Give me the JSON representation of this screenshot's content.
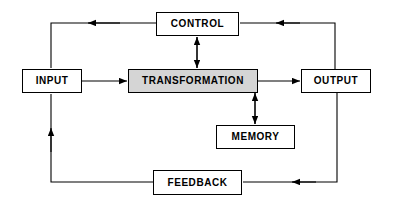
{
  "diagram": {
    "background_color": "#ffffff",
    "line_color": "#000000",
    "shaded_fill": "#d5d5d5",
    "nodes": {
      "control": {
        "label": "CONTROL",
        "fill": "#ffffff"
      },
      "input": {
        "label": "INPUT",
        "fill": "#ffffff"
      },
      "transformation": {
        "label": "TRANSFORMATION",
        "fill": "#d5d5d5"
      },
      "output": {
        "label": "OUTPUT",
        "fill": "#ffffff"
      },
      "memory": {
        "label": "MEMORY",
        "fill": "#ffffff"
      },
      "feedback": {
        "label": "FEEDBACK",
        "fill": "#ffffff"
      }
    },
    "connections": [
      {
        "from": "input",
        "to": "transformation",
        "arrow": "single",
        "direction": "right"
      },
      {
        "from": "transformation",
        "to": "output",
        "arrow": "single",
        "direction": "right"
      },
      {
        "from": "control",
        "to": "transformation",
        "arrow": "double",
        "direction": "vertical"
      },
      {
        "from": "transformation",
        "to": "memory",
        "arrow": "double",
        "direction": "vertical"
      },
      {
        "from": "output",
        "to": "control",
        "arrow": "single",
        "direction": "left"
      },
      {
        "from": "control",
        "to": "input",
        "arrow": "single",
        "direction": "left-down"
      },
      {
        "from": "output",
        "to": "feedback",
        "arrow": "single",
        "direction": "down-left"
      },
      {
        "from": "feedback",
        "to": "input",
        "arrow": "single",
        "direction": "left-up"
      }
    ]
  }
}
